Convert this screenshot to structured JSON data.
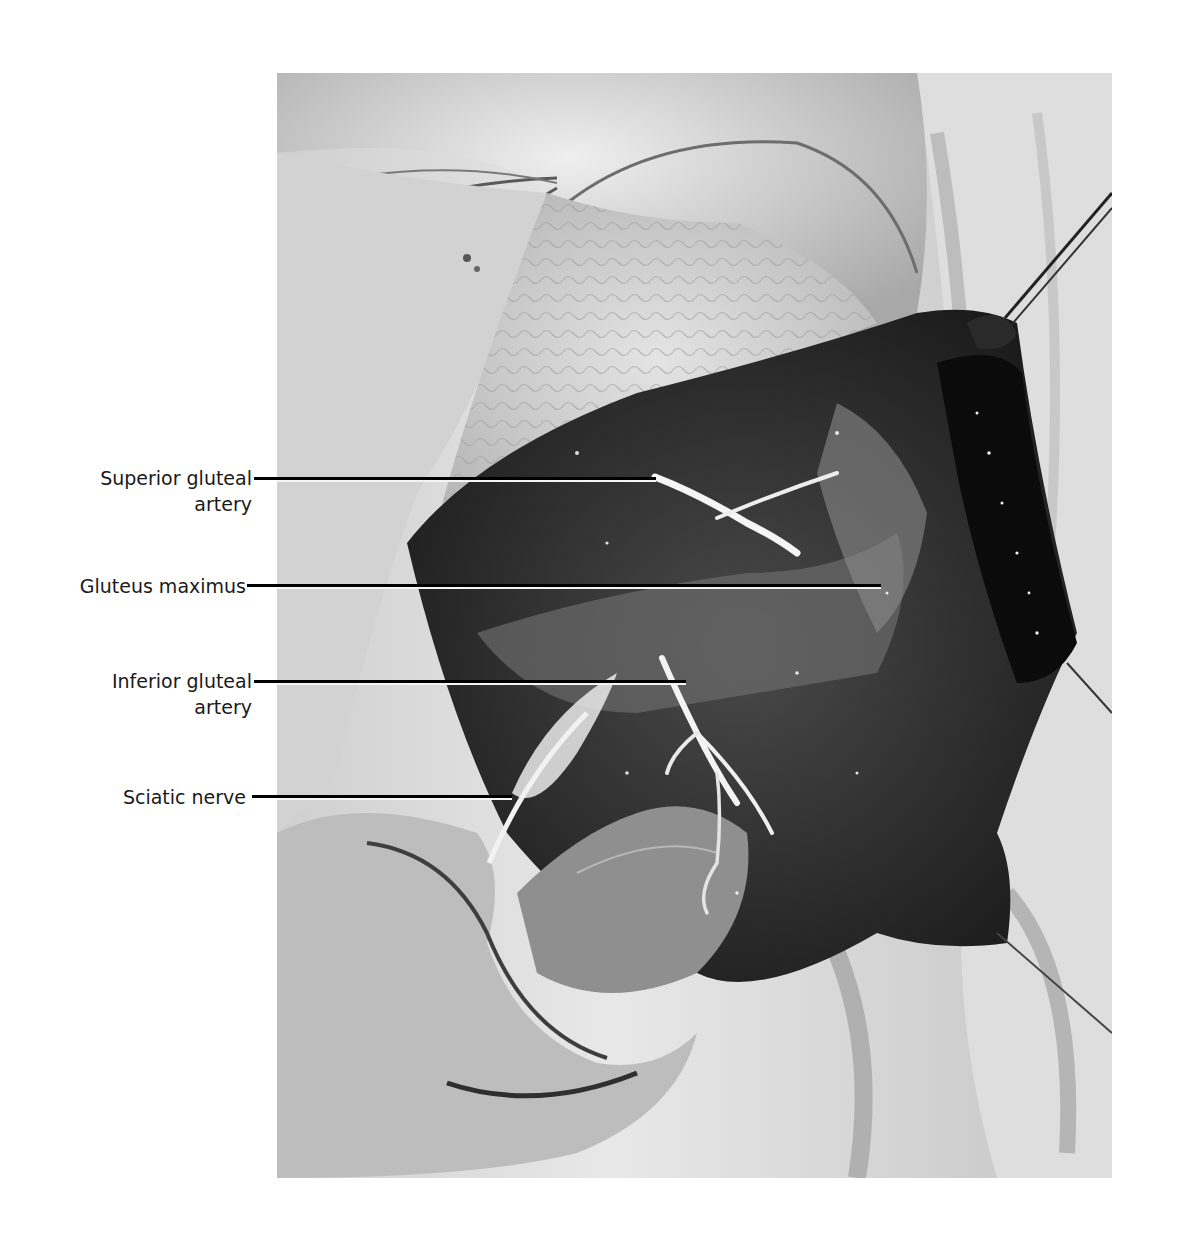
{
  "figure": {
    "labels": [
      {
        "id": "superior-gluteal-artery",
        "line1": "Superior gluteal",
        "line2": "artery"
      },
      {
        "id": "gluteus-maximus",
        "line1": "Gluteus maximus",
        "line2": ""
      },
      {
        "id": "inferior-gluteal-artery",
        "line1": "Inferior gluteal",
        "line2": "artery"
      },
      {
        "id": "sciatic-nerve",
        "line1": "Sciatic nerve",
        "line2": ""
      }
    ],
    "colors": {
      "background": "#ffffff",
      "label_text": "#1a1a1a",
      "leader_line": "#000000",
      "leader_highlight": "#f4f4f4"
    }
  }
}
